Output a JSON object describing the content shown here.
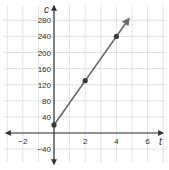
{
  "chart_data": {
    "type": "line",
    "title": "",
    "xlabel": "t",
    "ylabel": "c",
    "x_ticks": [
      -2,
      2,
      4,
      6
    ],
    "y_ticks": [
      -40,
      40,
      80,
      120,
      160,
      200,
      240,
      280
    ],
    "xlim": [
      -3.2,
      7.1
    ],
    "ylim": [
      -65,
      310
    ],
    "grid": true,
    "grid_x_step": 1,
    "grid_y_step": 40,
    "series": [
      {
        "name": "c vs t",
        "points": [
          {
            "x": 0,
            "y": 20
          },
          {
            "x": 2,
            "y": 130
          },
          {
            "x": 4,
            "y": 240
          }
        ],
        "line_extends_to": {
          "x": 4.8,
          "y": 284
        },
        "arrow_end": true,
        "color": "#6b6b6b",
        "marker_color": "#3a3a3a"
      }
    ],
    "axis_color": "#333333",
    "grid_color": "#e2e2e2"
  },
  "labels": {
    "x_axis": "t",
    "y_axis": "c"
  }
}
